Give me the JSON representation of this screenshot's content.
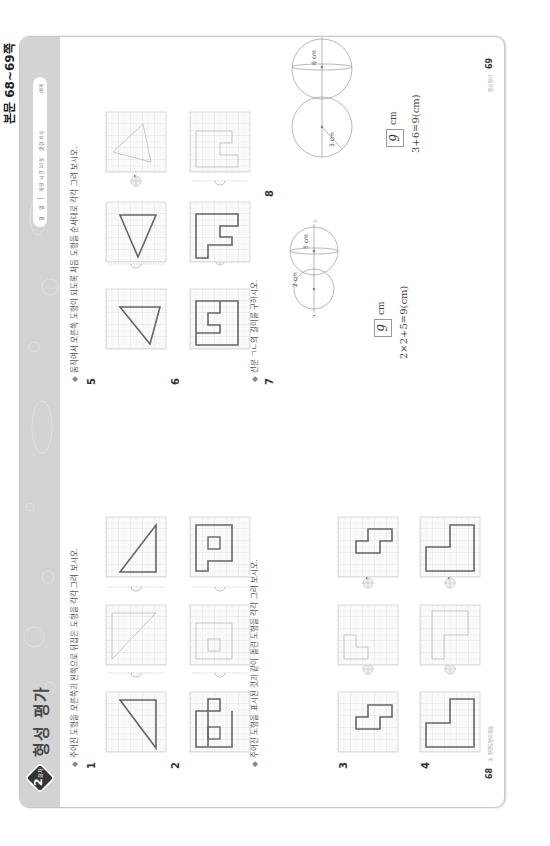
{
  "corner_label": "본문 68~69쪽",
  "header": {
    "badge_number": "2",
    "badge_suffix": "회차",
    "title": "형성 평가",
    "info": {
      "date_month": "월",
      "date_day": "일",
      "time_label": "제한 시간 10분",
      "score_label": "맞힌 개수",
      "score_total": "/8개"
    }
  },
  "left_page": {
    "section1": {
      "instruction": "주어진 도형을 오른쪽과 왼쪽으로 뒤집은 도형을 각각 그려 보시오.",
      "problems": [
        {
          "number": "1"
        },
        {
          "number": "2"
        }
      ]
    },
    "section2": {
      "instruction": "주어진 도형을 표시된 것과 같이 돌린 도형을 각각 그려 보시오.",
      "problems": [
        {
          "number": "3"
        },
        {
          "number": "4"
        }
      ]
    },
    "page_number": "68",
    "footer": "2. 평면도형의 이동"
  },
  "right_page": {
    "section3": {
      "instruction": "움직여서 오른쪽 도형이 되도록 처음 도형을 순서대로 각각 그려 보시오.",
      "problems": [
        {
          "number": "5"
        },
        {
          "number": "6"
        }
      ]
    },
    "section4": {
      "instruction": "선분 ㄱㄴ의 길이를 구하시오.",
      "problems": [
        {
          "number": "7",
          "labels": [
            "2 cm",
            "5 cm",
            "ㄱ",
            "ㄴ"
          ],
          "answer": "9",
          "unit": "cm",
          "expression": "2×2+5=9(cm)"
        },
        {
          "number": "8",
          "labels": [
            "3 cm",
            "6 cm",
            "ㄱ",
            "ㄴ"
          ],
          "answer": "9",
          "unit": "cm",
          "expression": "3+6=9(cm)"
        }
      ]
    },
    "page_number": "69",
    "footer": "형성 평가"
  }
}
